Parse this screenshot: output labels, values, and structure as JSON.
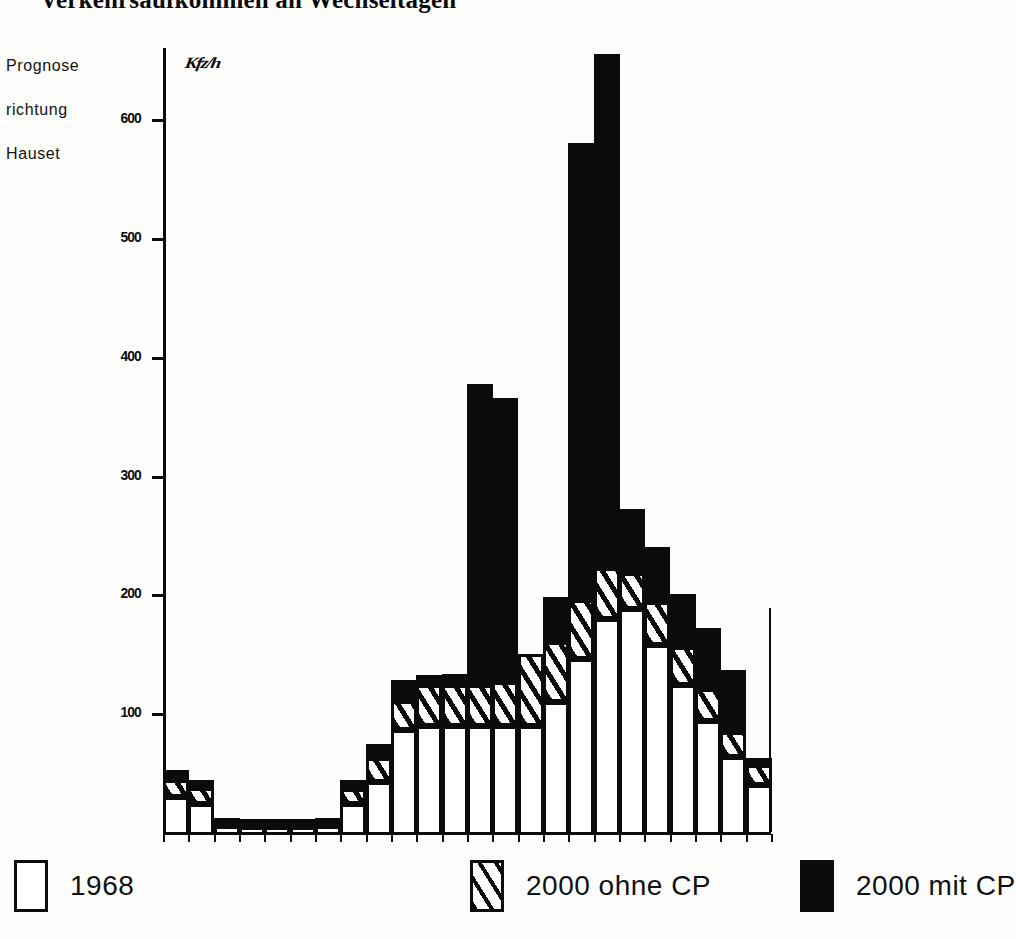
{
  "title": "Verkehrsaufkommen an Wechseltagen",
  "caption": {
    "lines": [
      "Prognose",
      "richtung",
      "Hauset"
    ]
  },
  "legend": {
    "items": [
      {
        "label": "1968",
        "swatch": "white-rect-icon"
      },
      {
        "label": "2000 ohne CP",
        "swatch": "hatched-rect-icon"
      },
      {
        "label": "2000 mit CP",
        "swatch": "solid-black-rect-icon"
      }
    ]
  },
  "chart_data": {
    "type": "bar",
    "title": "Verkehrsaufkommen an Wechseltagen",
    "subtitle": "Prognose richtung Hauset",
    "unit_label": "Kfz/h",
    "xlabel": "",
    "ylabel": "Kfz/h",
    "ylim": [
      0,
      660
    ],
    "yticks": [
      100,
      200,
      300,
      400,
      500,
      600
    ],
    "ytick_labels": [
      "100",
      "200",
      "300",
      "400",
      "500",
      "600"
    ],
    "grid": false,
    "legend_position": "below",
    "stacked": true,
    "n_bins": 24,
    "categories": [
      "0",
      "1",
      "2",
      "3",
      "4",
      "5",
      "6",
      "7",
      "8",
      "9",
      "10",
      "11",
      "12",
      "13",
      "14",
      "15",
      "16",
      "17",
      "18",
      "19",
      "20",
      "21",
      "22",
      "23"
    ],
    "series": [
      {
        "name": "1968",
        "fill": "white",
        "values": [
          32,
          26,
          8,
          7,
          7,
          7,
          8,
          26,
          45,
          88,
          92,
          92,
          92,
          92,
          92,
          112,
          148,
          182,
          190,
          160,
          126,
          96,
          66,
          42
        ]
      },
      {
        "name": "2000 ohne CP",
        "fill": "hatched",
        "values": [
          44,
          37,
          10,
          9,
          9,
          9,
          10,
          36,
          62,
          110,
          124,
          124,
          124,
          126,
          150,
          160,
          195,
          222,
          218,
          194,
          156,
          120,
          84,
          56
        ]
      },
      {
        "name": "2000 mit CP",
        "fill": "black",
        "values": [
          52,
          44,
          12,
          11,
          11,
          11,
          12,
          44,
          74,
          128,
          132,
          133,
          377,
          365,
          136,
          198,
          580,
          655,
          272,
          240,
          200,
          172,
          136,
          62
        ]
      }
    ],
    "colors": {
      "ink": "#0b0b0b",
      "paper": "#ffffff",
      "series_1968": "#ffffff",
      "series_2000_ohne_cp": "#ffffff",
      "series_2000_mit_cp": "#0b0b0b"
    }
  }
}
